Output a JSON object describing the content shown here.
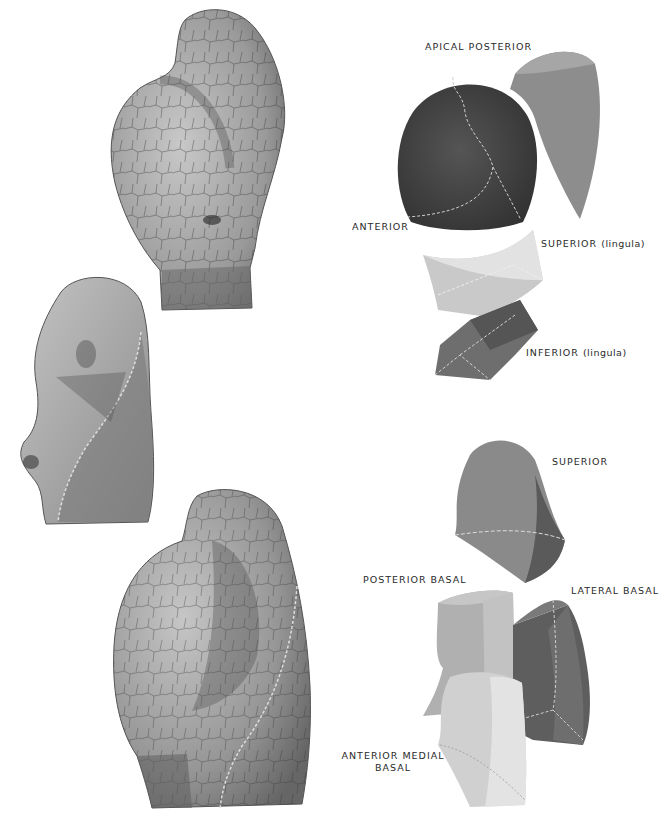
{
  "plate": {
    "subject": "Left lung bronchopulmonary segments",
    "views": [
      "lateral view (upper)",
      "medial view (middle)",
      "posterior-lateral view (lower)"
    ]
  },
  "labels": {
    "apical_posterior": "APICAL  POSTERIOR",
    "anterior": "ANTERIOR",
    "superior_lingula_main": "SUPERIOR",
    "superior_lingula_paren": "(lingula)",
    "inferior_lingula_main": "INFERIOR",
    "inferior_lingula_paren": "(lingula)",
    "superior": "SUPERIOR",
    "posterior_basal": "POSTERIOR  BASAL",
    "lateral_basal": "LATERAL  BASAL",
    "anterior_medial_basal_line1": "ANTERIOR  MEDIAL",
    "anterior_medial_basal_line2": "BASAL"
  },
  "colors": {
    "background": "#ffffff",
    "lung_light": "#b9b9b9",
    "lung_mid": "#8f8f8f",
    "lung_dark": "#5a5a5a",
    "crack": "#2e2e2e",
    "segment_apical_posterior": "#9a9a9a",
    "segment_anterior": "#3f3f3f",
    "segment_superior_lingula": "#d6d6d6",
    "segment_inferior_lingula": "#6e6e6e",
    "segment_superior": "#8a8a8a",
    "segment_posterior_basal": "#bdbdbd",
    "segment_lateral_basal": "#676767",
    "segment_anterior_medial_basal": "#dcdcdc",
    "label_text": "#2a2a2a",
    "dashed_line": "#d9d9d9"
  }
}
